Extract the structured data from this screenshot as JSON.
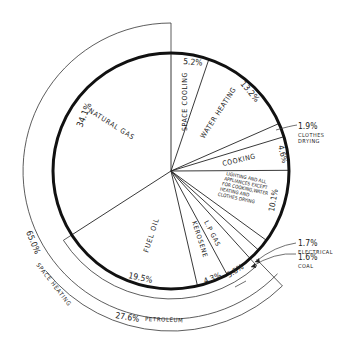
{
  "chart_data": {
    "type": "pie",
    "title": "",
    "start_angle_deg": 0,
    "direction": "clockwise",
    "slices": [
      {
        "label": "SPACE COOLING",
        "value": 5.2,
        "value_label": "5.2%"
      },
      {
        "label": "WATER HEATING",
        "value": 13.2,
        "value_label": "13.2%"
      },
      {
        "label": "CLOTHES DRYING",
        "value": 1.9,
        "value_label": "1.9%",
        "external": true
      },
      {
        "label": "COOKING",
        "value": 4.6,
        "value_label": "4.6%"
      },
      {
        "label": "LIGHTING AND ALL APPLIANCES EXCEPT FOR COOKING, WATER HEATING AND CLOTHES DRYING",
        "value": 10.1,
        "value_label": "10.1%"
      },
      {
        "label": "ELECTRICAL",
        "value": 1.7,
        "value_label": "1.7%",
        "external": true
      },
      {
        "label": "COAL",
        "value": 1.6,
        "value_label": "1.6%",
        "external": true
      },
      {
        "label": "L.P GAS",
        "value": 3.8,
        "value_label": "3.8%"
      },
      {
        "label": "KEROSENE",
        "value": 4.3,
        "value_label": "4.3%"
      },
      {
        "label": "FUEL OIL",
        "value": 19.5,
        "value_label": "19.5%"
      },
      {
        "label": "NATURAL GAS",
        "value": 34.1,
        "value_label": "34.1%"
      }
    ],
    "groups": [
      {
        "label": "SPACE HEATING",
        "value": 65.0,
        "value_label": "65.0%",
        "members": [
          "ELECTRICAL",
          "COAL",
          "L.P GAS",
          "KEROSENE",
          "FUEL OIL",
          "NATURAL GAS"
        ]
      },
      {
        "label": "PETROLEUM",
        "value": 27.6,
        "value_label": "27.6%",
        "members": [
          "L.P GAS",
          "KEROSENE",
          "FUEL OIL"
        ]
      }
    ]
  },
  "labels": {
    "natural_gas": "NATURAL GAS",
    "natural_gas_pct": "34.1%",
    "space_cooling": "SPACE COOLING",
    "space_cooling_pct": "5.2%",
    "water_heating": "WATER HEATING",
    "water_heating_pct": "13.2%",
    "clothes_drying_pct": "1.9%",
    "clothes_drying_1": "CLOTHES",
    "clothes_drying_2": "DRYING",
    "cooking": "COOKING",
    "cooking_pct": "4.6%",
    "lighting_1": "LIGHTING AND ALL",
    "lighting_2": "APPLIANCES EXCEPT",
    "lighting_3": "FOR COOKING,WATER",
    "lighting_4": "HEATING AND",
    "lighting_5": "CLOTHES DRYING",
    "lighting_pct": "10.1%",
    "electrical_pct": "1.7%",
    "electrical": "ELECTRICAL",
    "coal_pct": "1.6%",
    "coal": "COAL",
    "lp_gas": "L.P GAS",
    "lp_gas_pct": "3.8%",
    "kerosene": "KEROSENE",
    "kerosene_pct": "4.3%",
    "fuel_oil": "FUEL OIL",
    "fuel_oil_pct": "19.5%",
    "space_heating_pct": "65.0%",
    "space_heating": "SPACE HEATING",
    "petroleum_pct": "27.6%",
    "petroleum": "PETROLEUM"
  },
  "colors": {
    "ink": "#1a1a1a",
    "background": "#ffffff"
  }
}
